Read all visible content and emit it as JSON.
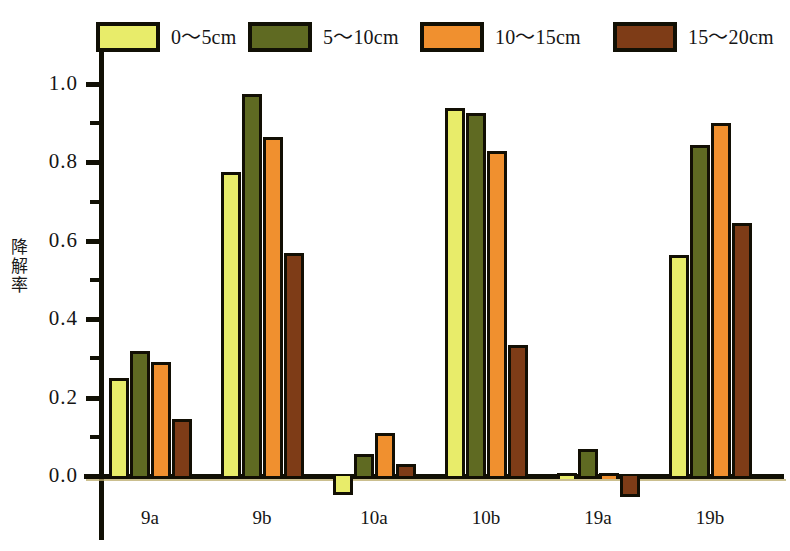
{
  "chart_data": {
    "type": "bar",
    "title": "",
    "subtitle": "",
    "xlabel": "",
    "ylabel": "降解率",
    "categories": [
      "9a",
      "9b",
      "10a",
      "10b",
      "19a",
      "19b"
    ],
    "series": [
      {
        "name": "0～5cm",
        "color": "#e8ec6a",
        "values": [
          0.25,
          0.775,
          -0.04,
          0.94,
          0.0,
          0.565
        ]
      },
      {
        "name": "5～10cm",
        "color": "#5f6a22",
        "values": [
          0.32,
          0.975,
          0.055,
          0.925,
          0.07,
          0.845
        ]
      },
      {
        "name": "10～15cm",
        "color": "#f0902f",
        "values": [
          0.29,
          0.865,
          0.11,
          0.83,
          0.0,
          0.9
        ]
      },
      {
        "name": "15～20cm",
        "color": "#7e3c17",
        "values": [
          0.145,
          0.57,
          0.03,
          0.335,
          -0.045,
          0.645
        ]
      }
    ],
    "ylim": [
      -0.06,
      1.08
    ],
    "ytick_labels": [
      "0.0",
      "0.2",
      "0.4",
      "0.6",
      "0.8",
      "1.0"
    ],
    "ytick_values": [
      0.0,
      0.2,
      0.4,
      0.6,
      0.8,
      1.0
    ],
    "yminor_values": [
      0.1,
      0.3,
      0.5,
      0.7,
      0.9
    ],
    "grid": false,
    "legend_position": "top",
    "legend": [
      "0～5cm",
      "5～10cm",
      "10～15cm",
      "15～20cm"
    ],
    "bar_edge_color": "#120f04",
    "axis_color": "#111005",
    "background": "#ffffff"
  },
  "legend": {
    "items": [
      {
        "label": "0～5cm",
        "swatch": "legend-swatch-0-5cm"
      },
      {
        "label": "5～10cm",
        "swatch": "legend-swatch-5-10cm"
      },
      {
        "label": "10～15cm",
        "swatch": "legend-swatch-10-15cm"
      },
      {
        "label": "15～20cm",
        "swatch": "legend-swatch-15-20cm"
      }
    ]
  },
  "axes": {
    "y_label_chars": [
      "降",
      "解",
      "率"
    ]
  }
}
